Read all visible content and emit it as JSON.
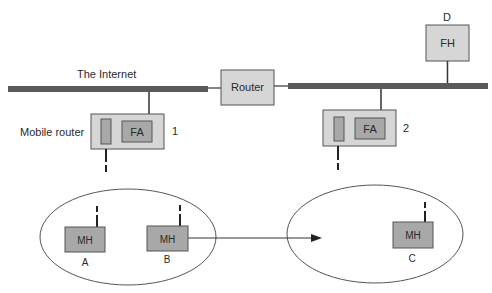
{
  "diagram": {
    "internet_label": "The Internet",
    "router_label": "Router",
    "fixed_host": {
      "label": "FH",
      "tag": "D"
    },
    "mobile_router_caption": "Mobile router",
    "mobile_routers": [
      {
        "agent_label": "FA",
        "number": "1"
      },
      {
        "agent_label": "FA",
        "number": "2"
      }
    ],
    "mobile_hosts": [
      {
        "label": "MH",
        "tag": "A"
      },
      {
        "label": "MH",
        "tag": "B"
      },
      {
        "label": "MH",
        "tag": "C"
      }
    ],
    "colors": {
      "backbone": "#5a5a5a",
      "box_light": "#d6d6d6",
      "box_dark": "#a8a8a8",
      "stroke": "#444444"
    }
  }
}
